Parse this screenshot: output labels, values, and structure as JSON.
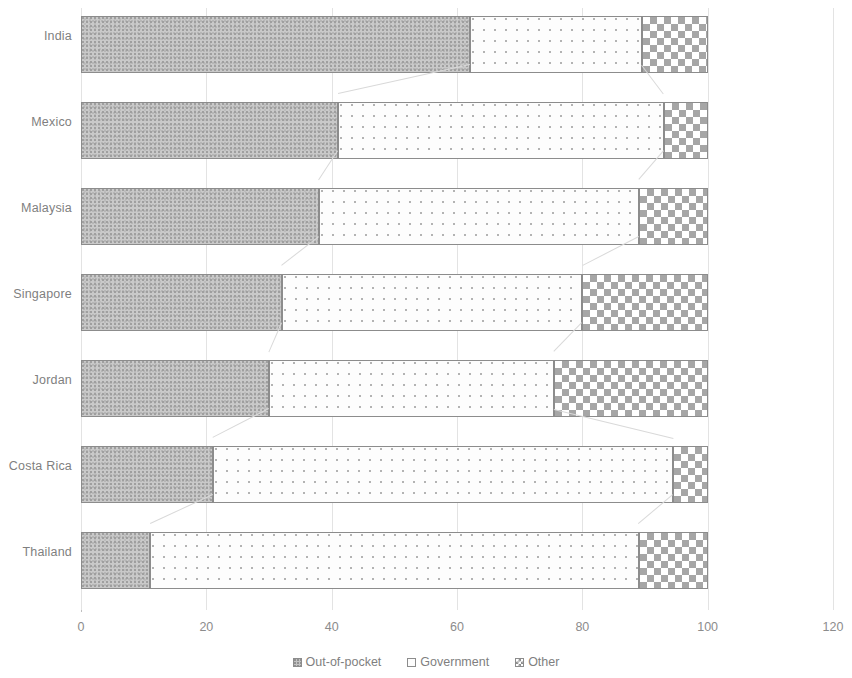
{
  "chart_data": {
    "type": "bar",
    "orientation": "horizontal",
    "stacked": true,
    "percent_stacked": true,
    "title": "",
    "subtitle": "",
    "xlabel": "",
    "ylabel": "",
    "xlim": [
      0,
      120
    ],
    "xticks": [
      0,
      20,
      40,
      60,
      80,
      100,
      120
    ],
    "xtick_labels": [
      "0",
      "20",
      "40",
      "60",
      "80",
      "100",
      "120"
    ],
    "grid": true,
    "grid_axis": "x",
    "legend_position": "bottom",
    "categories": [
      "India",
      "Mexico",
      "Malaysia",
      "Singapore",
      "Jordan",
      "Costa Rica",
      "Thailand"
    ],
    "series": [
      {
        "name": "Out-of-pocket",
        "pattern": "grey-noise",
        "values": [
          62,
          41,
          38,
          32,
          30,
          21,
          11
        ]
      },
      {
        "name": "Government",
        "pattern": "white-dotted",
        "values": [
          27.5,
          52,
          51,
          48,
          45.5,
          73.5,
          78
        ]
      },
      {
        "name": "Other",
        "pattern": "checkerboard",
        "values": [
          10.5,
          7,
          11,
          20,
          24.5,
          5.5,
          11
        ]
      }
    ]
  },
  "axis": {
    "ticks": [
      {
        "label": "0",
        "value": 0
      },
      {
        "label": "20",
        "value": 20
      },
      {
        "label": "40",
        "value": 40
      },
      {
        "label": "60",
        "value": 60
      },
      {
        "label": "80",
        "value": 80
      },
      {
        "label": "100",
        "value": 100
      },
      {
        "label": "120",
        "value": 120
      }
    ]
  },
  "legend": {
    "items": [
      {
        "label": "Out-of-pocket",
        "key": "oop"
      },
      {
        "label": "Government",
        "key": "gov"
      },
      {
        "label": "Other",
        "key": "oth"
      }
    ]
  },
  "colors": {
    "out_of_pocket": "#c9c9c9",
    "government": "#fdfdfd",
    "other": "#a6a6a6",
    "border": "#8c8c8c",
    "gridline": "#e3e3e3",
    "text": "#7f7f7f"
  }
}
